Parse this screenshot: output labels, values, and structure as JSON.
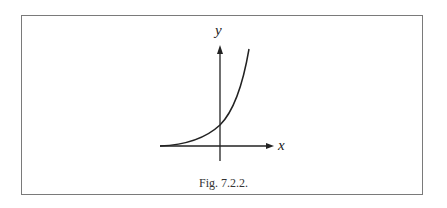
{
  "figure": {
    "caption": "Fig. 7.2.2.",
    "x_axis_label": "x",
    "y_axis_label": "y",
    "curve": "exponential growth curve, asymptotic to the negative x-axis, crossing the y-axis above the origin"
  },
  "colors": {
    "line": "#222222",
    "frame": "#7a7a7a",
    "background": "#ffffff"
  }
}
